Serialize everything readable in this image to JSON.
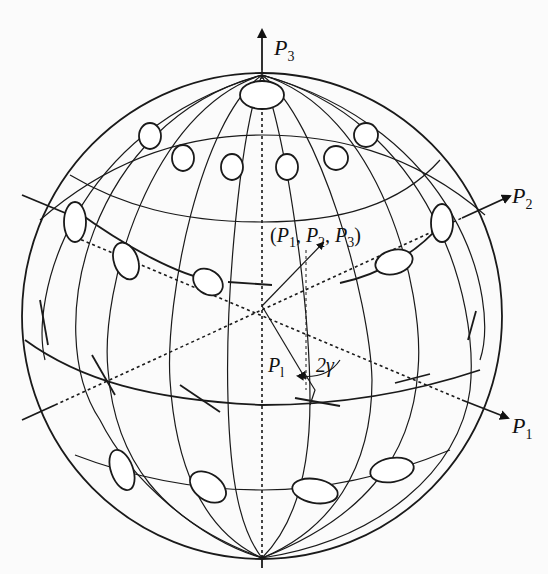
{
  "diagram": {
    "type": "poincare-sphere",
    "axes": [
      {
        "id": "p1",
        "symbol": "P",
        "subscript": "1"
      },
      {
        "id": "p2",
        "symbol": "P",
        "subscript": "2"
      },
      {
        "id": "p3",
        "symbol": "P",
        "subscript": "3"
      }
    ],
    "point_label": {
      "open": "(",
      "p1": "P",
      "s1": "1",
      "c1": ",",
      "p2": "P",
      "s2": "2",
      "c2": ",",
      "p3": "P",
      "s3": "3",
      "close": ")"
    },
    "vector_label": {
      "symbol": "P",
      "subscript": "l"
    },
    "angle_label": "2γ",
    "polarization_states": {
      "north_pole": "circular",
      "upper_latitudes": "elliptical (right-handed)",
      "equator": "linear",
      "lower_latitudes": "elliptical (left-handed)"
    }
  }
}
